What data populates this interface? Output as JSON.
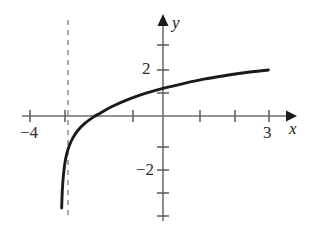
{
  "figure": {
    "type": "math-graph",
    "background": "#ffffff",
    "width": 318,
    "height": 227
  },
  "chart_data": {
    "type": "line",
    "title": "",
    "xlabel": "x",
    "ylabel": "y",
    "grid": false,
    "legend": null,
    "xlim": [
      -4.5,
      3.8
    ],
    "ylim": [
      -3.2,
      3.3
    ],
    "x_ticks": [
      -4,
      -3,
      -1,
      1,
      2,
      3
    ],
    "y_ticks": [
      3,
      2,
      1,
      -1,
      -2,
      -3
    ],
    "x_tick_labels": {
      "-4": "−4",
      "3": "3"
    },
    "y_tick_labels": {
      "2": "2",
      "-2": "−2"
    },
    "axis_origin_px": [
      163,
      116
    ],
    "x_unit_px": 34,
    "y_unit_px": 23,
    "asymptote": {
      "orientation": "vertical",
      "x": -3,
      "style": "dashed",
      "color": "#8c8c8c"
    },
    "series": [
      {
        "name": "logarithmic-curve",
        "color": "#1a1a1a",
        "x_intercept": -1.85,
        "points": [
          [
            -2.98,
            -4.0
          ],
          [
            -2.96,
            -3.2
          ],
          [
            -2.93,
            -2.6
          ],
          [
            -2.89,
            -2.1
          ],
          [
            -2.84,
            -1.7
          ],
          [
            -2.76,
            -1.3
          ],
          [
            -2.65,
            -0.95
          ],
          [
            -2.5,
            -0.62
          ],
          [
            -2.3,
            -0.32
          ],
          [
            -2.05,
            -0.05
          ],
          [
            -1.85,
            0.12
          ],
          [
            -1.5,
            0.41
          ],
          [
            -1.0,
            0.73
          ],
          [
            -0.5,
            0.99
          ],
          [
            0.0,
            1.2
          ],
          [
            0.6,
            1.41
          ],
          [
            1.2,
            1.6
          ],
          [
            1.8,
            1.75
          ],
          [
            2.4,
            1.88
          ],
          [
            3.1,
            2.0
          ]
        ]
      }
    ]
  },
  "labels": {
    "x_axis": "x",
    "y_axis": "y",
    "x_neg4": "−4",
    "x_3": "3",
    "y_2": "2",
    "y_neg2": "−2"
  }
}
